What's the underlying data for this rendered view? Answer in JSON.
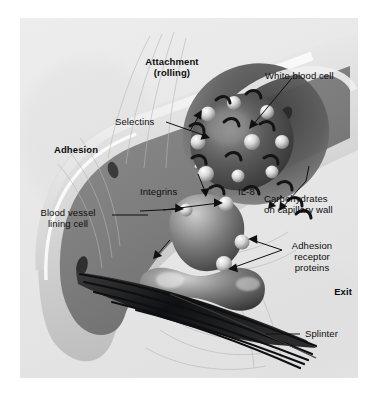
{
  "figure": {
    "kind": "scientific-illustration",
    "palette": {
      "page_background": "#ffffff",
      "panel_background": "#e9e9e9",
      "vessel_mid": "#9a9a9a",
      "vessel_dark": "#4a4a4a",
      "cell_highlight": "#f2f2f2",
      "splinter_dark": "#15171a",
      "label_text": "#0c0c0c"
    }
  },
  "labels": {
    "attachment": "Attachment\n(rolling)",
    "adhesion": "Adhesion",
    "exit": "Exit",
    "white_blood_cell": "White blood cell",
    "selectins": "Selectins",
    "integrins": "Integrins",
    "il8": "IL-8",
    "carbohydrates": "Carbohydrates\non capillary wall",
    "blood_vessel_lining_cell": "Blood vessel\nlining cell",
    "adhesion_receptor_proteins": "Adhesion\nreceptor\nproteins",
    "splinter": "Splinter"
  },
  "stages": [
    {
      "name": "attachment-rolling",
      "label": "Attachment\n(rolling)",
      "bold": true
    },
    {
      "name": "adhesion",
      "label": "Adhesion",
      "bold": true
    },
    {
      "name": "exit",
      "label": "Exit",
      "bold": true
    }
  ],
  "callouts": [
    {
      "name": "white-blood-cell",
      "label": "White blood cell",
      "lines": 1
    },
    {
      "name": "selectins",
      "label": "Selectins",
      "lines": 1
    },
    {
      "name": "integrins",
      "label": "Integrins",
      "lines": 1
    },
    {
      "name": "il-8",
      "label": "IL-8",
      "lines": 1
    },
    {
      "name": "carbohydrates-on-capillary-wall",
      "label": "Carbohydrates\non capillary wall",
      "lines": 2
    },
    {
      "name": "blood-vessel-lining-cell",
      "label": "Blood vessel\nlining cell",
      "lines": 2
    },
    {
      "name": "adhesion-receptor-proteins",
      "label": "Adhesion\nreceptor\nproteins",
      "lines": 3
    },
    {
      "name": "splinter",
      "label": "Splinter",
      "lines": 1
    }
  ]
}
